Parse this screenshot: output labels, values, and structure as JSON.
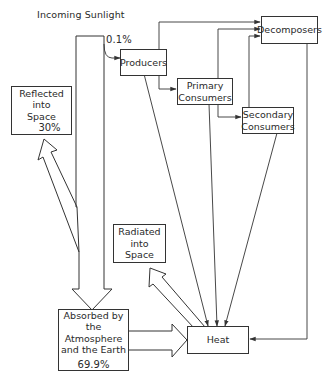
{
  "title": "Incoming Sunlight",
  "nodes": {
    "producers": {
      "label": "Producers"
    },
    "primary": {
      "line1": "Primary",
      "line2": "Consumers"
    },
    "secondary": {
      "line1": "Secondary",
      "line2": "Consumers"
    },
    "decomposers": {
      "label": "Decomposers"
    },
    "reflected": {
      "line1": "Reflected",
      "line2": "into",
      "line3": "Space",
      "percent": "30%"
    },
    "radiated": {
      "line1": "Radiated",
      "line2": "into",
      "line3": "Space"
    },
    "absorbed": {
      "line1": "Absorbed by",
      "line2": "the Atmosphere",
      "line3": "and the Earth",
      "percent": "69.9%"
    },
    "heat": {
      "label": "Heat"
    }
  },
  "flows": {
    "to_producers_percent": "0.1%"
  },
  "edges": [
    {
      "from": "Incoming Sunlight",
      "to": "Producers",
      "value": "0.1%"
    },
    {
      "from": "Incoming Sunlight",
      "to": "Reflected into Space",
      "value": "30%"
    },
    {
      "from": "Incoming Sunlight",
      "to": "Absorbed by the Atmosphere and the Earth",
      "value": "69.9%"
    },
    {
      "from": "Producers",
      "to": "Primary Consumers"
    },
    {
      "from": "Producers",
      "to": "Decomposers"
    },
    {
      "from": "Producers",
      "to": "Heat"
    },
    {
      "from": "Primary Consumers",
      "to": "Secondary Consumers"
    },
    {
      "from": "Primary Consumers",
      "to": "Decomposers"
    },
    {
      "from": "Primary Consumers",
      "to": "Heat"
    },
    {
      "from": "Secondary Consumers",
      "to": "Decomposers"
    },
    {
      "from": "Secondary Consumers",
      "to": "Heat"
    },
    {
      "from": "Decomposers",
      "to": "Heat"
    },
    {
      "from": "Absorbed by the Atmosphere and the Earth",
      "to": "Heat"
    },
    {
      "from": "Heat",
      "to": "Radiated into Space"
    }
  ],
  "colors": {
    "stroke": "#333333",
    "background": "#ffffff",
    "text": "#2a2a2a"
  }
}
